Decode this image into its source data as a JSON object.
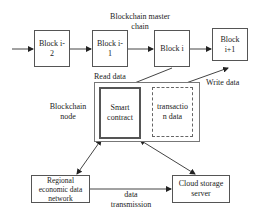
{
  "title": {
    "line1": "Blockchain master",
    "line2": "chain"
  },
  "blocks": [
    {
      "line1": "Block i-",
      "line2": "2"
    },
    {
      "line1": "Block i-",
      "line2": "1"
    },
    {
      "line1": "Block i",
      "line2": ""
    },
    {
      "line1": "Block",
      "line2": "i+1"
    }
  ],
  "node": {
    "label_line1": "Blockchain",
    "label_line2": "node",
    "smart_contract": {
      "line1": "Smart",
      "line2": "contract"
    },
    "transaction_data": {
      "line1": "transactio",
      "line2": "n data"
    }
  },
  "edge_labels": {
    "read_data": "Read data",
    "write_data": "Write data",
    "data_transmission_line1": "data",
    "data_transmission_line2": "transmission"
  },
  "regional": {
    "line1": "Regional",
    "line2": "economic data",
    "line3": "network"
  },
  "cloud": {
    "line1": "Cloud storage",
    "line2": "server"
  }
}
